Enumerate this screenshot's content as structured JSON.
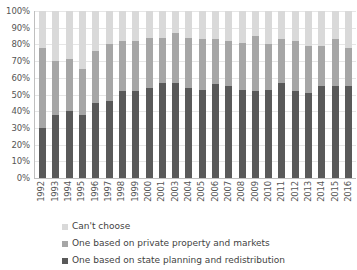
{
  "chart_data": {
    "type": "bar",
    "stacked": true,
    "stack_mode": "percent",
    "title": "",
    "subtitle": "",
    "xlabel": "",
    "ylabel": "",
    "ylim": [
      0,
      100
    ],
    "grid": true,
    "legend_position": "bottom-left",
    "y_ticks": [
      "0%",
      "10%",
      "20%",
      "30%",
      "40%",
      "50%",
      "60%",
      "70%",
      "80%",
      "90%",
      "100%"
    ],
    "y_tick_values": [
      0,
      10,
      20,
      30,
      40,
      50,
      60,
      70,
      80,
      90,
      100
    ],
    "categories": [
      "1992",
      "1993",
      "1994",
      "1995",
      "1996",
      "1997",
      "1998",
      "1999",
      "2000",
      "2001",
      "2003",
      "2004",
      "2005",
      "2006",
      "2007",
      "2008",
      "2009",
      "2010",
      "2011",
      "2012",
      "2013",
      "2014",
      "2015",
      "2016"
    ],
    "series": [
      {
        "name": "One based on state planning and redistribution",
        "color": "#595959",
        "values": [
          30,
          38,
          40,
          38,
          45,
          46,
          52,
          52,
          54,
          57,
          57,
          54,
          53,
          56,
          55,
          53,
          52,
          53,
          57,
          52,
          51,
          55,
          55,
          55
        ]
      },
      {
        "name": "One based on private property and markets",
        "color": "#a6a6a6",
        "values": [
          48,
          32,
          31,
          27,
          31,
          34,
          30,
          30,
          30,
          27,
          30,
          30,
          30,
          27,
          27,
          28,
          33,
          27,
          26,
          30,
          28,
          24,
          28,
          23
        ]
      },
      {
        "name": "Can't choose",
        "color": "#d9d9d9",
        "values": [
          22,
          30,
          29,
          35,
          24,
          20,
          18,
          18,
          16,
          16,
          13,
          16,
          17,
          17,
          18,
          19,
          15,
          20,
          17,
          18,
          21,
          21,
          17,
          22
        ]
      }
    ],
    "legend": [
      {
        "label": "Can't choose",
        "color": "#d9d9d9"
      },
      {
        "label": "One based on private property and markets",
        "color": "#a6a6a6"
      },
      {
        "label": "One based on state planning and redistribution",
        "color": "#595959"
      }
    ]
  }
}
